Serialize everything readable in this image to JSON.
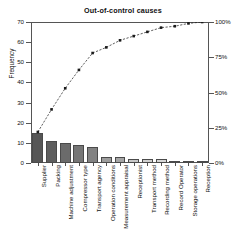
{
  "chart_data": {
    "type": "bar",
    "title": "Out-of-control causes",
    "xlabel": "",
    "ylabel": "Frequency",
    "y2label": "Cumulative Percentage",
    "grid": false,
    "legend": "none",
    "ylim": [
      0,
      70
    ],
    "y2lim": [
      0,
      100
    ],
    "yticks": [
      0,
      10,
      20,
      30,
      40,
      50,
      60,
      70
    ],
    "y2ticks": [
      "0%",
      "25%",
      "50%",
      "75%",
      "100%"
    ],
    "y2tick_values": [
      0,
      25,
      50,
      75,
      100
    ],
    "categories": [
      "Supplier",
      "Packing",
      "Machine adjustment",
      "Compressor type",
      "Transport agency",
      "Operation conditions",
      "Measurement appraisal",
      "Receptionist",
      "Transport method",
      "Recording method",
      "Record Operator",
      "Storage operations",
      "Reception"
    ],
    "values": [
      15,
      11,
      10,
      9,
      8,
      3,
      3,
      2,
      2,
      2,
      1,
      1,
      1
    ],
    "total": 68,
    "series": [
      {
        "name": "Frequency",
        "type": "bar",
        "values": [
          15,
          11,
          10,
          9,
          8,
          3,
          3,
          2,
          2,
          2,
          1,
          1,
          1
        ]
      },
      {
        "name": "Cumulative Percentage",
        "type": "line",
        "values": [
          22,
          38,
          53,
          66,
          78,
          82,
          87,
          90,
          93,
          96,
          97,
          99,
          100
        ]
      }
    ],
    "bar_colors": [
      "#565656",
      "#5e5e5e",
      "#6b6b6b",
      "#767676",
      "#828282",
      "#9d9d9d",
      "#a5a5a5",
      "#c8c8c8",
      "#cfcfcf",
      "#d6d6d6",
      "#e6e6e6",
      "#ebebeb",
      "#f0f0f0"
    ],
    "line_color": "#1a1a1a",
    "axis_color": "#555555"
  }
}
